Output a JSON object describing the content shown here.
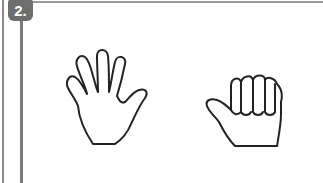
{
  "exercise": {
    "number_label": "2.",
    "badge_color": "#6e6e6e",
    "line_color": "#8a8a8a"
  },
  "illustrations": [
    {
      "name": "open-hand",
      "description": "Open hand, five fingers spread"
    },
    {
      "name": "fist-thumb-out",
      "description": "Closed fist with thumb extended"
    }
  ]
}
